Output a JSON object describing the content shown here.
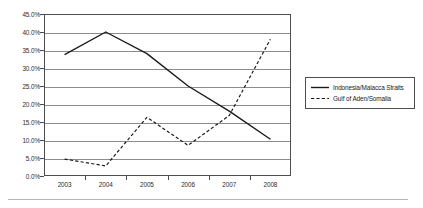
{
  "chart_data": {
    "type": "line",
    "title": "",
    "subtitle": "",
    "xlabel": "",
    "ylabel": "",
    "categories": [
      "2003",
      "2004",
      "2005",
      "2006",
      "2007",
      "2008"
    ],
    "x": [
      2003,
      2004,
      2005,
      2006,
      2007,
      2008
    ],
    "ylim": [
      0,
      45
    ],
    "ytick_labels": [
      "0.0%",
      "5.0%",
      "10.0%",
      "15.0%",
      "20.0%",
      "25.0%",
      "30.0%",
      "35.0%",
      "40.0%",
      "45.0%"
    ],
    "ytick_values": [
      0,
      5,
      10,
      15,
      20,
      25,
      30,
      35,
      40,
      45
    ],
    "y_unit": "%",
    "grid": "horizontal",
    "legend_position": "right",
    "series": [
      {
        "name": "Indonesia/Malacca Straits",
        "style": "solid",
        "color": "#1a1a1a",
        "values": [
          33.7,
          40.0,
          34.0,
          25.0,
          18.0,
          10.2
        ]
      },
      {
        "name": "Gulf of Aden/Somalia",
        "style": "dashed",
        "color": "#1a1a1a",
        "values": [
          4.7,
          2.8,
          16.3,
          8.5,
          16.8,
          38.0
        ]
      }
    ]
  },
  "legend": {
    "items": [
      {
        "label": "Indonesia/Malacca Straits",
        "style": "solid"
      },
      {
        "label": "Gulf of Aden/Somalia",
        "style": "dashed"
      }
    ]
  },
  "colors": {
    "plot_border": "#4d4d4d",
    "gridline": "#8c8c8c",
    "line": "#1a1a1a",
    "text": "#2b2b2b",
    "footer_rule": "#b5b5b5",
    "background": "#ffffff"
  }
}
